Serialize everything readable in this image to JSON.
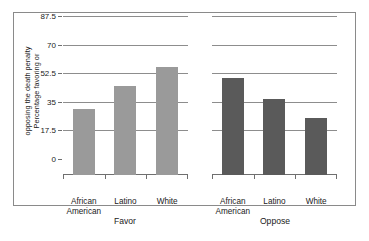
{
  "chart_data": {
    "type": "bar",
    "title": "",
    "xlabel": "",
    "ylabel": "Percentage favoring or opposing the death penalty",
    "ylabel_line1": "Percentage favoring or",
    "ylabel_line2": "opposing the death penalty",
    "ylim": [
      0,
      87.5
    ],
    "yticks": [
      0,
      17.5,
      35,
      52.5,
      70,
      87.5
    ],
    "ytick_labels": [
      "0",
      "17.5",
      "35",
      "52.5",
      "70",
      "87.5"
    ],
    "grid": true,
    "legend": "none",
    "panels": [
      "Favor",
      "Oppose"
    ],
    "categories": [
      "African American",
      "Latino",
      "White"
    ],
    "category_lines": [
      [
        "African",
        "American"
      ],
      [
        "Latino"
      ],
      [
        "White"
      ]
    ],
    "series": [
      {
        "name": "Favor",
        "color": "#9a9a9a",
        "values": [
          40.4,
          54.5,
          66.0
        ]
      },
      {
        "name": "Oppose",
        "color": "#5a5a5a",
        "values": [
          59.4,
          46.5,
          34.9
        ]
      }
    ]
  },
  "axis": {
    "tick_0": "0",
    "tick_1": "17.5",
    "tick_2": "35",
    "tick_3": "52.5",
    "tick_4": "70",
    "tick_5": "87.5"
  },
  "panels": {
    "favor": {
      "label": "Favor",
      "cat0_line1": "African",
      "cat0_line2": "American",
      "cat1_line1": "Latino",
      "cat2_line1": "White"
    },
    "oppose": {
      "label": "Oppose",
      "cat0_line1": "African",
      "cat0_line2": "American",
      "cat1_line1": "Latino",
      "cat2_line1": "White"
    }
  },
  "colors": {
    "favor_bar": "#9a9a9a",
    "oppose_bar": "#5a5a5a",
    "gridline": "#8d8d8d",
    "frame": "#8a8a8a",
    "background": "#ffffff"
  }
}
